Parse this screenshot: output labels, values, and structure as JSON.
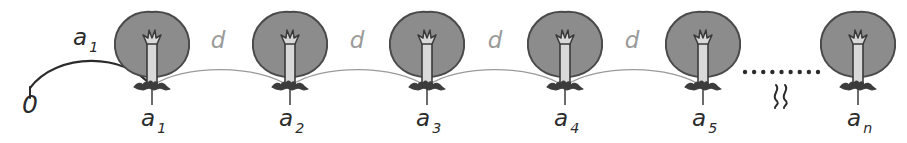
{
  "figure": {
    "background_color": "#ffffff",
    "width": 907,
    "height": 143,
    "colors": {
      "ink_dark": "#2b2b2b",
      "ink_light": "#9a9a9a",
      "canopy_fill": "#8c8c8c",
      "canopy_stroke": "#4a4a4a",
      "trunk_fill": "#d9d9d9",
      "trunk_stroke": "#3a3a3a",
      "root_fill": "#3c3c3c",
      "tick_stroke": "#3a3a3a"
    }
  },
  "origin": {
    "label": "0",
    "x": 30,
    "y": 113
  },
  "first_gap_label": {
    "base": "a",
    "sub": "1",
    "x": 80,
    "y": 45
  },
  "gap_labels": [
    {
      "base": "d",
      "sub": "",
      "x": 218,
      "y": 48
    },
    {
      "base": "d",
      "sub": "",
      "x": 357,
      "y": 48
    },
    {
      "base": "d",
      "sub": "",
      "x": 495,
      "y": 48
    },
    {
      "base": "d",
      "sub": "",
      "x": 632,
      "y": 48
    }
  ],
  "trees": [
    {
      "name": "tree-a1",
      "base": "a",
      "sub": "1",
      "x": 152
    },
    {
      "name": "tree-a2",
      "base": "a",
      "sub": "2",
      "x": 290
    },
    {
      "name": "tree-a3",
      "base": "a",
      "sub": "3",
      "x": 427
    },
    {
      "name": "tree-a4",
      "base": "a",
      "sub": "4",
      "x": 565
    },
    {
      "name": "tree-a5",
      "base": "a",
      "sub": "5",
      "x": 703
    },
    {
      "name": "tree-an",
      "base": "a",
      "sub": "n",
      "x": 858
    }
  ],
  "arcs": [
    {
      "name": "arc-origin-to-a1",
      "from": 30,
      "to": 152,
      "dark": true
    },
    {
      "name": "arc-a1-to-a2",
      "from": 152,
      "to": 290,
      "dark": false
    },
    {
      "name": "arc-a2-to-a3",
      "from": 290,
      "to": 427,
      "dark": false
    },
    {
      "name": "arc-a3-to-a4",
      "from": 427,
      "to": 565,
      "dark": false
    },
    {
      "name": "arc-a4-to-a5",
      "from": 565,
      "to": 703,
      "dark": false
    }
  ],
  "ellipsis": {
    "name": "ellipsis-dots",
    "dot_count": 9,
    "start_x": 745,
    "end_x": 818,
    "y": 72,
    "radius": 2.2
  },
  "break_symbol": {
    "name": "axis-break-squiggle",
    "x": 781,
    "y": 96,
    "glyph": "wavy-double-line"
  },
  "chart_data": {
    "type": "diagram",
    "positions": [
      "a1",
      "a2",
      "a3",
      "a4",
      "a5",
      "an"
    ],
    "first_distance_label": "a1",
    "spacing_label": "d",
    "origin_label": "0"
  }
}
